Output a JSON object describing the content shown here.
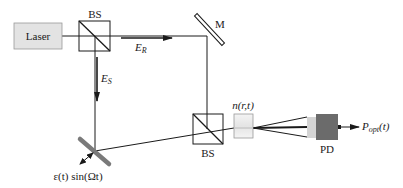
{
  "diagram": {
    "type": "optical-setup",
    "components": {
      "laser": {
        "label": "Laser"
      },
      "beam_splitter_top": {
        "label": "BS"
      },
      "mirror": {
        "label": "M"
      },
      "beam_splitter_bottom": {
        "label": "BS"
      },
      "medium": {
        "label": "n(r,t)"
      },
      "photodetector": {
        "label": "PD"
      },
      "vibrating_mirror": {
        "label": "ε(t) sin(Ωt)"
      }
    },
    "beams": {
      "reference": {
        "symbol": "E",
        "subscript": "R"
      },
      "signal": {
        "symbol": "E",
        "subscript": "S"
      },
      "output": {
        "symbol": "P",
        "subscript": "opt",
        "suffix": "(t)"
      }
    },
    "colors": {
      "line": "#1a1a1a",
      "laser_fill": "#e3e3e3",
      "medium_fill": "#f2f2f2",
      "pd_body": "#6b6b6b",
      "pd_front": "#d4d4d4",
      "vib_mirror": "#7a7a7a"
    }
  }
}
